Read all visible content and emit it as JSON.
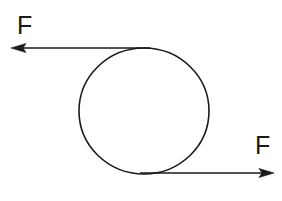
{
  "figure": {
    "background_color": "#ffffff",
    "stroke_color": "#1a1a1a",
    "text_color": "#1a1a1a",
    "width": 282,
    "height": 201
  },
  "body": {
    "shape_name": "circle",
    "center_x": 144,
    "center_y": 111,
    "radius_x": 65,
    "radius_y": 63,
    "stroke_width": 1.6,
    "fill": "none"
  },
  "arrows": [
    {
      "id": "top-force-arrow",
      "label": "F",
      "direction": "left",
      "from_x": 150,
      "from_y": 48,
      "to_x": 12,
      "to_y": 48,
      "label_x": 17,
      "label_y": 34,
      "stroke_width": 1.4
    },
    {
      "id": "bottom-force-arrow",
      "label": "F",
      "direction": "right",
      "from_x": 140,
      "from_y": 173,
      "to_x": 274,
      "to_y": 173,
      "label_x": 255,
      "label_y": 154,
      "stroke_width": 1.4
    }
  ]
}
